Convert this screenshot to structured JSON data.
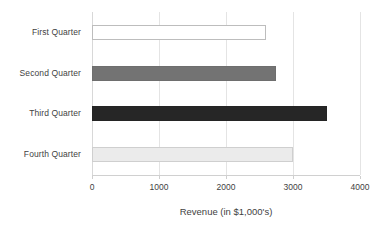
{
  "chart_data": {
    "type": "bar",
    "orientation": "horizontal",
    "title": "",
    "subtitle": "",
    "xlabel": "Revenue (in $1,000's)",
    "ylabel": "",
    "categories": [
      "First Quarter",
      "Second Quarter",
      "Third Quarter",
      "Fourth Quarter"
    ],
    "values": [
      2600,
      2750,
      3500,
      3000
    ],
    "series": [
      {
        "name": "Revenue",
        "values": [
          2600,
          2750,
          3500,
          3000
        ]
      }
    ],
    "xlim": [
      0,
      4000
    ],
    "xticks": [
      0,
      1000,
      2000,
      3000,
      4000
    ],
    "xtick_labels": [
      "0",
      "1000",
      "2000",
      "3000",
      "4000"
    ],
    "grid": true,
    "grid_axis": "x",
    "legend": false,
    "legend_position": "none",
    "bar_colors": [
      "#ffffff",
      "#737373",
      "#262626",
      "#ebebeb"
    ],
    "bar_border_colors": [
      "#bdbdbd",
      "#6e6e6e",
      "#242424",
      "#cfcfcf"
    ],
    "grid_color": "#e4e4e4",
    "axis_color": "#d0d0d0",
    "text_color": "#3f3f3f",
    "background_color": "#ffffff",
    "annotations": []
  }
}
